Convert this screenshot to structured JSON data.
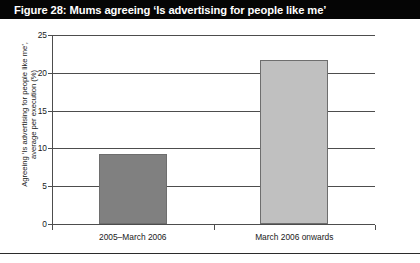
{
  "figure": {
    "title": "Figure 28: Mums agreeing ‘Is advertising for people like me’",
    "caption": ""
  },
  "colors": {
    "title_bar_bg": "#050505",
    "title_text": "#ffffff",
    "bar_1": "#808080",
    "bar_2": "#c0c0c0",
    "bar_border": "#6e6e6e",
    "axis": "#4d4d4d",
    "background": "#ffffff"
  },
  "chart_data": {
    "type": "bar",
    "title": "Figure 28: Mums agreeing ‘Is advertising for people like me’",
    "categories": [
      "2005–March 2006",
      "March 2006 onwards"
    ],
    "values": [
      9.3,
      21.7
    ],
    "colors": [
      "#808080",
      "#c0c0c0"
    ],
    "xlabel": "",
    "ylabel": "Agreeing ‘Is advertising for people like me’, average per execution (%)",
    "ylabel_lines": [
      "Agreeing ‘Is advertising for people like me’,",
      "average per execution (%)"
    ],
    "ylim": [
      0,
      25
    ],
    "yticks": [
      0,
      5,
      10,
      15,
      20,
      25
    ],
    "ytick_labels": [
      "0",
      "5",
      "10",
      "15",
      "20",
      "25"
    ],
    "grid": true,
    "grid_axis": "y",
    "legend": false
  }
}
